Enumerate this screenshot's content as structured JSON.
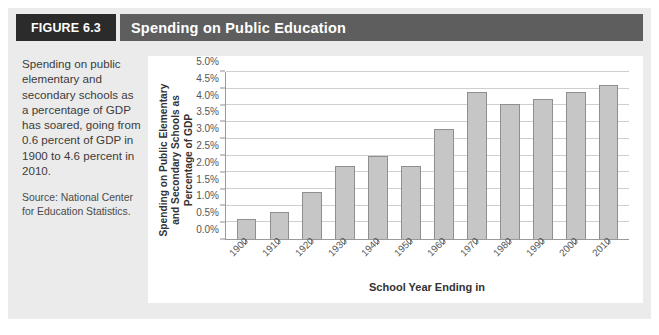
{
  "figure": {
    "number_label": "FIGURE 6.3",
    "title": "Spending on Public Education",
    "label_bg": "#2b2b2b",
    "title_bg": "#5e5e5e",
    "panel_bg": "#ebebeb"
  },
  "caption": {
    "lead": "Spending on public elementary and secondary schools as a percentage of GDP has soared, going from 0.6 percent of GDP in 1900 to 4.6 percent in 2010.",
    "source": "Source: National Center for Education Statistics."
  },
  "chart_data": {
    "type": "bar",
    "title": "Spending on Public Education",
    "xlabel": "School Year Ending in",
    "ylabel": "Spending on Public Elementary and Secondary Schools as Percentage of GDP",
    "categories": [
      "1900",
      "1910",
      "1920",
      "1930",
      "1940",
      "1950",
      "1960",
      "1970",
      "1980",
      "1990",
      "2000",
      "2010"
    ],
    "values": [
      0.6,
      0.8,
      1.4,
      2.2,
      2.5,
      2.2,
      3.3,
      4.4,
      4.05,
      4.2,
      4.4,
      4.6
    ],
    "value_labels": [
      "0.6%",
      "0.8%",
      "1.4%",
      "2.2%",
      "2.5%",
      "2.2%",
      "3.3%",
      "4.4%",
      "4.05%",
      "4.2%",
      "4.4%",
      "4.6%"
    ],
    "ylim": [
      0,
      5.0
    ],
    "ytick_values": [
      0.0,
      0.5,
      1.0,
      1.5,
      2.0,
      2.5,
      3.0,
      3.5,
      4.0,
      4.5,
      5.0
    ],
    "ytick_labels": [
      "0.0%",
      "0.5%",
      "1.0%",
      "1.5%",
      "2.0%",
      "2.5%",
      "3.0%",
      "3.5%",
      "4.0%",
      "4.5%",
      "5.0%"
    ],
    "grid": true,
    "legend": false,
    "bar_fill": "#c6c6c6",
    "bar_stroke": "#8f8f8f",
    "gridline_color": "#cfcfcf",
    "axis_color": "#9a9a9a"
  }
}
